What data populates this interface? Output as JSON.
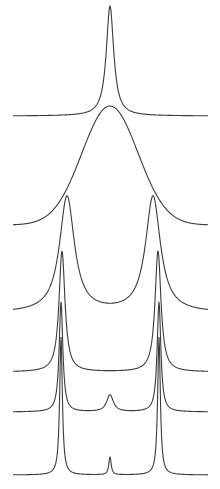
{
  "figure": {
    "stroke_color": "#3a3a3a",
    "background": "#ffffff",
    "x_range": [
      13,
      208
    ]
  },
  "curves": [
    {
      "name": "single-narrow-peak",
      "baseline_y": 116,
      "peaks": [
        {
          "x": 110,
          "top_y": 6,
          "width": 4.5,
          "shape": "lorentz"
        }
      ]
    },
    {
      "name": "broad-band",
      "baseline_y": 225,
      "peaks": [
        {
          "x": 110,
          "top_y": 106,
          "width": 28,
          "shape": "gauss"
        }
      ]
    },
    {
      "name": "doublet-broad",
      "baseline_y": 313,
      "peaks": [
        {
          "x": 67,
          "top_y": 197,
          "width": 9,
          "shape": "lorentz"
        },
        {
          "x": 153,
          "top_y": 197,
          "width": 9,
          "shape": "lorentz"
        }
      ]
    },
    {
      "name": "doublet-medium",
      "baseline_y": 372,
      "peaks": [
        {
          "x": 62,
          "top_y": 251,
          "width": 3.6,
          "shape": "lorentz"
        },
        {
          "x": 158,
          "top_y": 251,
          "width": 3.6,
          "shape": "lorentz"
        }
      ]
    },
    {
      "name": "doublet-with-center-bump",
      "baseline_y": 412,
      "peaks": [
        {
          "x": 61,
          "top_y": 302,
          "width": 2.2,
          "shape": "lorentz"
        },
        {
          "x": 159,
          "top_y": 302,
          "width": 2.2,
          "shape": "lorentz"
        },
        {
          "x": 110,
          "top_y": 395,
          "width": 4,
          "shape": "lorentz"
        }
      ]
    },
    {
      "name": "triplet-sharp",
      "baseline_y": 475,
      "peaks": [
        {
          "x": 61,
          "top_y": 337,
          "width": 1.6,
          "shape": "lorentz"
        },
        {
          "x": 159,
          "top_y": 337,
          "width": 1.6,
          "shape": "lorentz"
        },
        {
          "x": 110,
          "top_y": 457,
          "width": 1.4,
          "shape": "lorentz"
        }
      ]
    }
  ]
}
